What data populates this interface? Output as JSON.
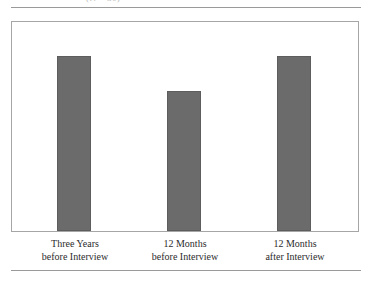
{
  "caption": {
    "fragment": "(N = 30)"
  },
  "chart_data": {
    "type": "bar",
    "title": "",
    "subtitle": "",
    "xlabel": "",
    "ylabel": "",
    "ylim": [
      0,
      36
    ],
    "grid": false,
    "legend": false,
    "bar_color": "#6b6b6b",
    "bar_edge_color": "#5d5d5d",
    "frame_color": "#a6a6a6",
    "categories": [
      "Three Years before Interview",
      "12 Months before Interview",
      "12 Months after Interview"
    ],
    "category_lines": [
      [
        "Three Years",
        "before Interview"
      ],
      [
        "12 Months",
        "before Interview"
      ],
      [
        "12 Months",
        "after Interview"
      ]
    ],
    "values": [
      30,
      24,
      30
    ],
    "value_labels": [
      "30",
      "24",
      "30"
    ],
    "bar_heights_px": [
      175,
      140,
      175
    ],
    "value_label_tops_px": [
      38,
      73,
      38
    ]
  }
}
